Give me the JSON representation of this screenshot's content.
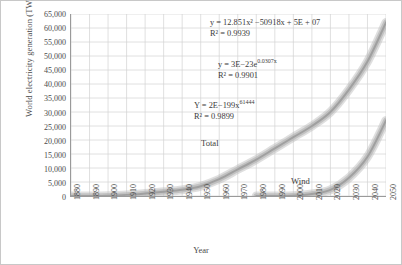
{
  "chart_data": {
    "type": "line",
    "title": "",
    "xlabel": "Year",
    "ylabel": "World electricity generation (TWh)",
    "xlim": [
      1880,
      2050
    ],
    "ylim": [
      0,
      65000
    ],
    "grid": true,
    "legend_position": "inline-annotations",
    "xticks": [
      "1880",
      "1890",
      "1900",
      "1910",
      "1920",
      "1930",
      "1940",
      "1950",
      "1960",
      "1970",
      "1980",
      "1990",
      "2000",
      "2010",
      "2020",
      "2030",
      "2040",
      "2050"
    ],
    "yticks": [
      "0",
      "5,000",
      "10,000",
      "15,000",
      "20,000",
      "25,000",
      "30,000",
      "35,000",
      "40,000",
      "45,000",
      "50,000",
      "55,000",
      "60,000",
      "65,000"
    ],
    "ytick_values": [
      0,
      5000,
      10000,
      15000,
      20000,
      25000,
      30000,
      35000,
      40000,
      45000,
      50000,
      55000,
      60000,
      65000
    ],
    "series": [
      {
        "name": "Total",
        "color": "#9a9a9a",
        "band_color": "#b8b8b8",
        "x": [
          1880,
          1890,
          1900,
          1910,
          1920,
          1930,
          1940,
          1950,
          1960,
          1970,
          1980,
          1990,
          2000,
          2010,
          2020,
          2030,
          2040,
          2050
        ],
        "values": [
          0,
          30,
          120,
          400,
          900,
          1500,
          2200,
          3500,
          6000,
          9500,
          13000,
          17000,
          21000,
          25000,
          30000,
          38000,
          48000,
          62000
        ]
      },
      {
        "name": "Wind",
        "color": "#9a9a9a",
        "band_color": "#b8b8b8",
        "x": [
          1980,
          1990,
          2000,
          2010,
          2020,
          2030,
          2040,
          2050
        ],
        "values": [
          0,
          10,
          100,
          700,
          2200,
          6500,
          14000,
          27000
        ]
      }
    ],
    "annotations": [
      {
        "id": "eq-total-poly",
        "line1": "y = 12.851x² −50918x + 5E + 07",
        "line2": "R² = 0.9939"
      },
      {
        "id": "eq-total-exp",
        "line1": "y = 3E−23e",
        "sup1": "0.0307x",
        "line2": "R² = 0.9901"
      },
      {
        "id": "eq-wind-power",
        "line1": "Y = 2E−199x",
        "sup1": "61444",
        "line2": "R² = 0.9899"
      }
    ],
    "curve_labels": [
      {
        "id": "label-total",
        "text": "Total"
      },
      {
        "id": "label-wind",
        "text": "Wind"
      }
    ]
  }
}
